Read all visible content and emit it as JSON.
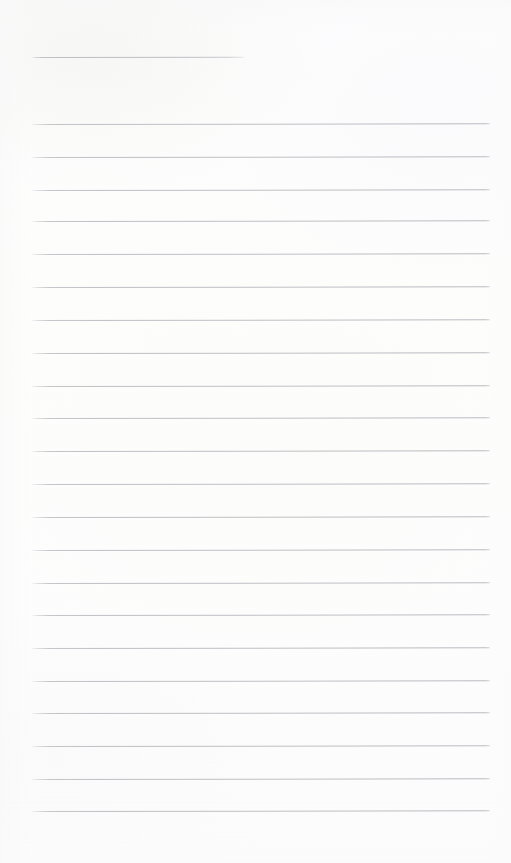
{
  "document": {
    "kind": "ruled-notepad-page",
    "title": "",
    "body_text": "",
    "content_note": "blank ruled page - no written text present"
  },
  "canvas": {
    "width": 511,
    "height": 863,
    "background_color": "#fdfdfd"
  },
  "ruling": {
    "line_color": "#c0c0c6",
    "line_thickness_px": 1,
    "line_spacing_px": 33,
    "left_margin_px": 32,
    "right_margin_px": 490,
    "body_line_count": 22,
    "heading_rule_count": 1,
    "first_body_line_y": 124,
    "last_body_line_y": 811,
    "bottom_blank_space_px": 51
  },
  "heading_rule": {
    "label": "title-rule",
    "x_start": 32,
    "x_end": 244,
    "y": 57,
    "width": 212
  },
  "body_lines": [
    {
      "index": 1,
      "y": 124,
      "x_start": 32,
      "x_end": 490,
      "text": ""
    },
    {
      "index": 2,
      "y": 157,
      "x_start": 32,
      "x_end": 490,
      "text": ""
    },
    {
      "index": 3,
      "y": 190,
      "x_start": 32,
      "x_end": 490,
      "text": ""
    },
    {
      "index": 4,
      "y": 221,
      "x_start": 32,
      "x_end": 490,
      "text": ""
    },
    {
      "index": 5,
      "y": 254,
      "x_start": 32,
      "x_end": 490,
      "text": ""
    },
    {
      "index": 6,
      "y": 287,
      "x_start": 32,
      "x_end": 490,
      "text": ""
    },
    {
      "index": 7,
      "y": 320,
      "x_start": 32,
      "x_end": 490,
      "text": ""
    },
    {
      "index": 8,
      "y": 353,
      "x_start": 32,
      "x_end": 490,
      "text": ""
    },
    {
      "index": 9,
      "y": 386,
      "x_start": 32,
      "x_end": 490,
      "text": ""
    },
    {
      "index": 10,
      "y": 418,
      "x_start": 32,
      "x_end": 490,
      "text": ""
    },
    {
      "index": 11,
      "y": 451,
      "x_start": 32,
      "x_end": 490,
      "text": ""
    },
    {
      "index": 12,
      "y": 484,
      "x_start": 32,
      "x_end": 490,
      "text": ""
    },
    {
      "index": 13,
      "y": 517,
      "x_start": 32,
      "x_end": 490,
      "text": ""
    },
    {
      "index": 14,
      "y": 550,
      "x_start": 32,
      "x_end": 490,
      "text": ""
    },
    {
      "index": 15,
      "y": 583,
      "x_start": 32,
      "x_end": 490,
      "text": ""
    },
    {
      "index": 16,
      "y": 615,
      "x_start": 32,
      "x_end": 490,
      "text": ""
    },
    {
      "index": 17,
      "y": 648,
      "x_start": 32,
      "x_end": 490,
      "text": ""
    },
    {
      "index": 18,
      "y": 681,
      "x_start": 32,
      "x_end": 490,
      "text": ""
    },
    {
      "index": 19,
      "y": 713,
      "x_start": 32,
      "x_end": 490,
      "text": ""
    },
    {
      "index": 20,
      "y": 746,
      "x_start": 32,
      "x_end": 490,
      "text": ""
    },
    {
      "index": 21,
      "y": 779,
      "x_start": 32,
      "x_end": 490,
      "text": ""
    },
    {
      "index": 22,
      "y": 811,
      "x_start": 32,
      "x_end": 490,
      "text": ""
    }
  ]
}
